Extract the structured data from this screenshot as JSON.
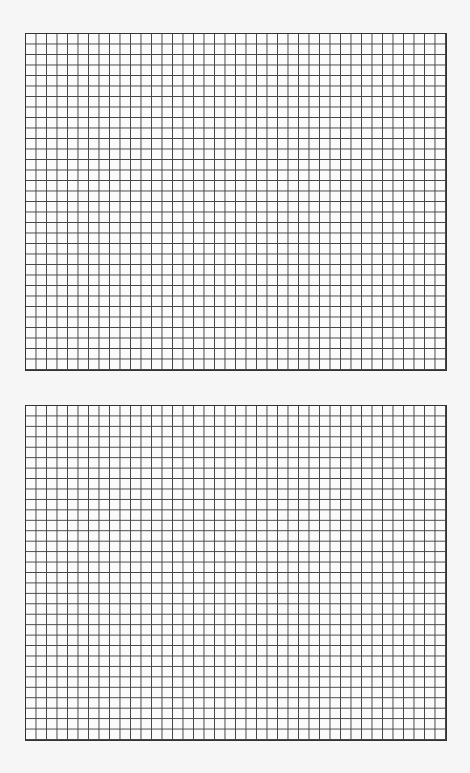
{
  "page": {
    "background": "#f6f6f6",
    "line_color": "#444444"
  },
  "grids": [
    {
      "name": "top-graph-grid",
      "left": 25,
      "top": 33,
      "width": 422,
      "height": 338,
      "columns": 40,
      "rows": 32
    },
    {
      "name": "bottom-graph-grid",
      "left": 25,
      "top": 405,
      "width": 422,
      "height": 336,
      "columns": 40,
      "rows": 32
    }
  ]
}
